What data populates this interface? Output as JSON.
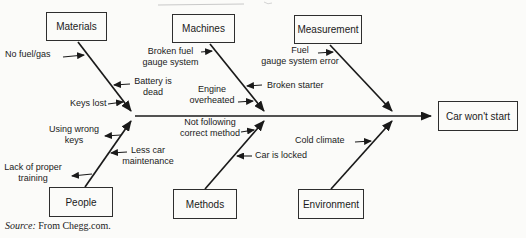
{
  "colors": {
    "ink": "#1a1a1a",
    "background": "#fbfbf9",
    "box_border": "#2e2e2e"
  },
  "diagram": {
    "type": "fishbone-cause-effect",
    "effect": "Car won't start",
    "categories": [
      {
        "label": "Materials",
        "causes": [
          "No fuel/gas",
          "Battery is\ndead",
          "Keys lost"
        ]
      },
      {
        "label": "Machines",
        "causes": [
          "Broken fuel\ngauge system",
          "Engine\noverheated",
          "Broken starter"
        ]
      },
      {
        "label": "Measurement",
        "causes": [
          "Fuel\ngauge system error"
        ]
      },
      {
        "label": "People",
        "causes": [
          "Using wrong\nkeys",
          "Less car\nmaintenance",
          "Lack of proper\ntraining"
        ]
      },
      {
        "label": "Methods",
        "causes": [
          "Not following\ncorrect method",
          "Car is locked"
        ]
      },
      {
        "label": "Environment",
        "causes": [
          "Cold climate"
        ]
      }
    ],
    "source": {
      "prefix": "Source:",
      "text": "From Chegg.com."
    }
  }
}
